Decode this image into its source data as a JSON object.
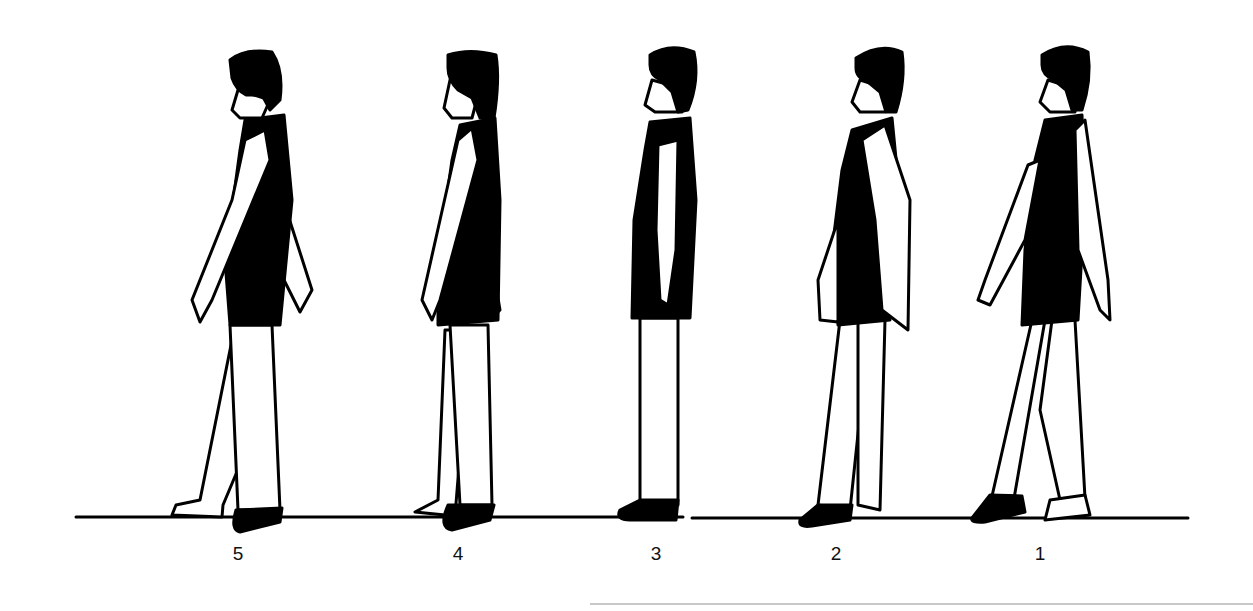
{
  "figure": {
    "colors": {
      "ink": "#000000",
      "background": "#ffffff"
    },
    "figures": [
      {
        "label": "5",
        "cx": 238
      },
      {
        "label": "4",
        "cx": 458
      },
      {
        "label": "3",
        "cx": 656
      },
      {
        "label": "2",
        "cx": 836
      },
      {
        "label": "1",
        "cx": 1040
      }
    ]
  }
}
